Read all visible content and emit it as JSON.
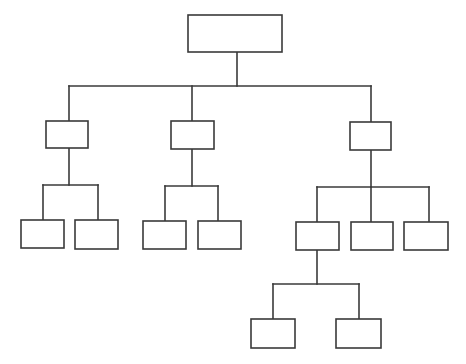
{
  "diagram": {
    "type": "org-chart",
    "stroke_color": "#3a3a3a",
    "background": "#ffffff",
    "stroke_width": 1.6,
    "nodes": [
      {
        "id": "root",
        "level": 0,
        "x": 188,
        "y": 15,
        "w": 94,
        "h": 37,
        "label": ""
      },
      {
        "id": "a",
        "level": 1,
        "x": 46,
        "y": 121,
        "w": 42,
        "h": 27,
        "label": ""
      },
      {
        "id": "b",
        "level": 1,
        "x": 171,
        "y": 121,
        "w": 43,
        "h": 28,
        "label": ""
      },
      {
        "id": "c",
        "level": 1,
        "x": 350,
        "y": 122,
        "w": 41,
        "h": 28,
        "label": ""
      },
      {
        "id": "a1",
        "level": 2,
        "x": 21,
        "y": 220,
        "w": 43,
        "h": 28,
        "label": ""
      },
      {
        "id": "a2",
        "level": 2,
        "x": 75,
        "y": 220,
        "w": 43,
        "h": 29,
        "label": ""
      },
      {
        "id": "b1",
        "level": 2,
        "x": 143,
        "y": 221,
        "w": 43,
        "h": 28,
        "label": ""
      },
      {
        "id": "b2",
        "level": 2,
        "x": 198,
        "y": 221,
        "w": 43,
        "h": 28,
        "label": ""
      },
      {
        "id": "c1",
        "level": 2,
        "x": 296,
        "y": 222,
        "w": 43,
        "h": 28,
        "label": ""
      },
      {
        "id": "c2",
        "level": 2,
        "x": 351,
        "y": 222,
        "w": 42,
        "h": 28,
        "label": ""
      },
      {
        "id": "c3",
        "level": 2,
        "x": 404,
        "y": 222,
        "w": 44,
        "h": 28,
        "label": ""
      },
      {
        "id": "c1a",
        "level": 3,
        "x": 251,
        "y": 319,
        "w": 44,
        "h": 29,
        "label": ""
      },
      {
        "id": "c1b",
        "level": 3,
        "x": 336,
        "y": 319,
        "w": 45,
        "h": 29,
        "label": ""
      }
    ],
    "connectors": [
      {
        "from": "root",
        "stem_x": 237,
        "stem_top": 52,
        "bar_y": 86,
        "bar_x1": 69,
        "bar_x2": 371,
        "drops": [
          69,
          192,
          371
        ],
        "drop_bottom": [
          121,
          121,
          122
        ]
      },
      {
        "from": "a",
        "stem_x": 69,
        "stem_top": 148,
        "bar_y": 185,
        "bar_x1": 43,
        "bar_x2": 98,
        "drops": [
          43,
          98
        ],
        "drop_bottom": [
          220,
          220
        ]
      },
      {
        "from": "b",
        "stem_x": 192,
        "stem_top": 149,
        "bar_y": 186,
        "bar_x1": 165,
        "bar_x2": 218,
        "drops": [
          165,
          218
        ],
        "drop_bottom": [
          221,
          221
        ]
      },
      {
        "from": "c",
        "stem_x": 371,
        "stem_top": 150,
        "bar_y": 187,
        "bar_x1": 317,
        "bar_x2": 429,
        "drops": [
          317,
          371,
          429
        ],
        "drop_bottom": [
          222,
          222,
          222
        ]
      },
      {
        "from": "c1",
        "stem_x": 317,
        "stem_top": 250,
        "bar_y": 284,
        "bar_x1": 273,
        "bar_x2": 359,
        "drops": [
          273,
          359
        ],
        "drop_bottom": [
          319,
          319
        ]
      }
    ]
  }
}
